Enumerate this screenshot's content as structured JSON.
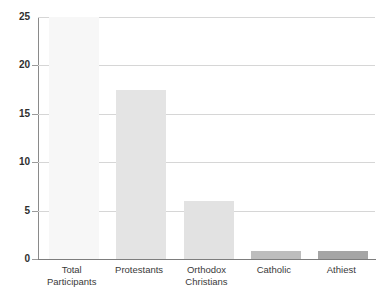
{
  "chart_data": {
    "type": "bar",
    "title": "",
    "subtitle": "",
    "xlabel": "",
    "ylabel": "",
    "categories": [
      "Total Participants",
      "Protestants",
      "Orthodox Christians",
      "Catholic",
      "Athiest"
    ],
    "category_lines": [
      [
        "Total",
        "Participants"
      ],
      [
        "Protestants",
        ""
      ],
      [
        "Orthodox",
        "Christians"
      ],
      [
        "Catholic",
        ""
      ],
      [
        "Athiest",
        ""
      ]
    ],
    "values": [
      25,
      17.5,
      6,
      0.8,
      0.8
    ],
    "bar_colors": [
      "#f7f7f7",
      "#e4e4e4",
      "#e2e2e2",
      "#bdbdbd",
      "#a5a5a5"
    ],
    "ylim": [
      0,
      25
    ],
    "yticks": [
      0,
      5,
      10,
      15,
      20,
      25
    ],
    "ytick_labels": [
      "0",
      "5",
      "10",
      "15",
      "20",
      "25"
    ],
    "grid": true,
    "grid_color": "#d6d6d6",
    "axis_color": "#7d7d7d",
    "legend": false,
    "legend_position": "none",
    "background": "#ffffff"
  }
}
